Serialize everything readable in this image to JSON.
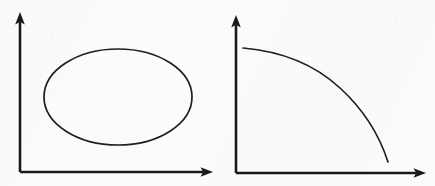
{
  "figure": {
    "title": "",
    "background_color": "#fbfbfa",
    "ink_color": "#1a1a1a",
    "width": 435,
    "height": 186,
    "panel_count": 2
  },
  "panels": [
    {
      "id": "panel-left",
      "name": "closed-curve-diagram",
      "label": "",
      "axes": {
        "origin": [
          20,
          172
        ],
        "y_axis_top": [
          20,
          14
        ],
        "x_axis_right": [
          212,
          172
        ],
        "arrowheads": [
          "y-axis-up",
          "x-axis-right"
        ],
        "x_tick_labels": [],
        "y_tick_labels": [],
        "xlabel": "",
        "ylabel": "",
        "grid": false
      },
      "curve": {
        "name": "ellipse",
        "shape": "closed-ellipse",
        "center": [
          118,
          97
        ],
        "radius_x": 74,
        "radius_y": 48
      }
    },
    {
      "id": "panel-right",
      "name": "decreasing-concave-curve-diagram",
      "label": "",
      "axes": {
        "origin": [
          18,
          173
        ],
        "y_axis_top": [
          18,
          17
        ],
        "x_axis_right": [
          207,
          173
        ],
        "arrowheads": [
          "y-axis-up",
          "x-axis-right"
        ],
        "x_tick_labels": [],
        "y_tick_labels": [],
        "xlabel": "",
        "ylabel": "",
        "grid": false
      },
      "curve": {
        "name": "concave-decreasing-frontier",
        "shape": "concave-decreasing",
        "start_point": [
          25,
          48
        ],
        "end_point": [
          170,
          162
        ]
      }
    }
  ],
  "chart_data": {
    "type": "line",
    "title": "",
    "xlabel": "",
    "ylabel": "",
    "grid": false,
    "legend": null,
    "charts": [
      {
        "id": "closed-curve",
        "type": "line",
        "title": "",
        "description": "closed oval (ellipse) drawn in the first quadrant",
        "closed": true,
        "xlim": [
          0,
          100
        ],
        "ylim": [
          0,
          100
        ],
        "x": [
          50,
          60,
          70,
          80,
          88,
          94,
          98,
          100,
          98,
          94,
          88,
          80,
          70,
          60,
          50,
          40,
          30,
          20,
          12,
          6,
          2,
          0,
          2,
          6,
          12,
          20,
          30,
          40,
          50
        ],
        "y": [
          100,
          99,
          96,
          91,
          84,
          76,
          66,
          55,
          44,
          34,
          26,
          19,
          13,
          9,
          7,
          9,
          13,
          19,
          26,
          34,
          44,
          55,
          66,
          76,
          84,
          91,
          96,
          99,
          100
        ]
      },
      {
        "id": "concave-decreasing-curve",
        "type": "line",
        "title": "",
        "description": "monotonically decreasing concave curve resembling a production possibility frontier",
        "closed": false,
        "xlim": [
          0,
          100
        ],
        "ylim": [
          0,
          100
        ],
        "x": [
          0,
          10,
          20,
          30,
          40,
          50,
          60,
          70,
          78,
          86,
          92,
          96,
          99,
          100
        ],
        "y": [
          100,
          98,
          95,
          91,
          86,
          79,
          70,
          59,
          49,
          37,
          25,
          15,
          6,
          0
        ]
      }
    ]
  }
}
